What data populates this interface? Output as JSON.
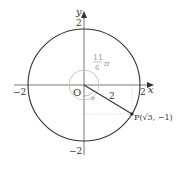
{
  "diagram": {
    "type": "unit-circle-angle",
    "circle": {
      "center": "O",
      "radius": 2
    },
    "axes": {
      "x_label": "x",
      "y_label": "y",
      "origin_label": "O"
    },
    "ticks": {
      "x_pos": "2",
      "x_neg": "−2",
      "y_pos": "2",
      "y_neg": "−2"
    },
    "angle": {
      "numerator": "11",
      "denominator": "6",
      "pi": "π",
      "small_angle": "π"
    },
    "segment_label": "2",
    "point": {
      "name": "P",
      "label": "P(√3, −1)",
      "x": "√3",
      "y": "−1"
    },
    "colors": {
      "stroke": "#333333",
      "guide": "#bbbbbb",
      "angle_text": "#999999"
    }
  }
}
